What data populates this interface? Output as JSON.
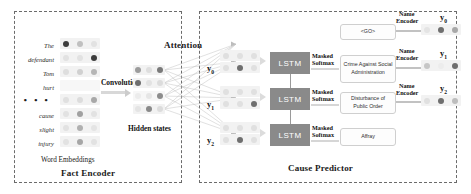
{
  "figure": {
    "width": 471,
    "height": 194,
    "type": "neural-network-architecture-diagram",
    "background": "#ffffff"
  },
  "panels": [
    {
      "id": "fact-encoder",
      "title": "Fact Encoder"
    },
    {
      "id": "cause-predictor",
      "title": "Cause Predictor"
    }
  ],
  "fact_encoder": {
    "title": "Fact Encoder",
    "word_embeddings_caption": "Word Embeddings",
    "hidden_states_caption": "Hidden states",
    "convolution_label": "Convolution",
    "words": [
      {
        "text": "The"
      },
      {
        "text": "defendant"
      },
      {
        "text": "Tom"
      },
      {
        "text": "hurt"
      },
      {
        "text": "• • •",
        "is_ellipsis": true
      },
      {
        "text": "cause"
      },
      {
        "text": "slight"
      },
      {
        "text": "injury"
      }
    ],
    "embedding_rows": [
      {
        "dots": [
          "dark",
          "mid",
          "light"
        ]
      },
      {
        "dots": [
          "light",
          "light",
          "dark"
        ]
      },
      {
        "dots": [
          "light",
          "light",
          "mid"
        ]
      },
      {
        "dots": [
          "blank",
          "blank",
          "blank"
        ]
      },
      {
        "dots": [
          "light",
          "light",
          "mid"
        ]
      },
      {
        "dots": [
          "light",
          "mid",
          "light"
        ]
      },
      {
        "dots": [
          "light",
          "mid",
          "light"
        ]
      },
      {
        "dots": [
          "light",
          "mid",
          "light"
        ]
      }
    ],
    "hidden_state_rows": [
      {
        "dots": [
          "mid",
          "light",
          "dark"
        ]
      },
      {
        "dots": [
          "dark",
          "light",
          "light"
        ]
      },
      {
        "dots": [
          "light",
          "light",
          "dark"
        ]
      },
      {
        "dots": [
          "light",
          "mid",
          "light"
        ]
      }
    ]
  },
  "attention": {
    "label": "Attention"
  },
  "cause_predictor": {
    "title": "Cause Predictor",
    "decoder_steps": [
      {
        "y_label": "y",
        "y_subscript": "0",
        "input_dots": [
          "light",
          "dark",
          "light"
        ],
        "softmax_label": "Masked\nSoftmax",
        "softmax_line1": "Masked",
        "softmax_line2": "Softmax",
        "class_label": "Crime Against Social Administration",
        "name_encoder_line1": "Name",
        "name_encoder_line2": "Encoder",
        "output_label": "y",
        "output_subscript": "0",
        "output_dots": [
          "light",
          "dark",
          "mid"
        ]
      },
      {
        "y_label": "y",
        "y_subscript": "1",
        "input_dots": [
          "light",
          "light",
          "dark"
        ],
        "softmax_line1": "Masked",
        "softmax_line2": "Softmax",
        "class_label": "Disturbance of Public Order",
        "name_encoder_line1": "Name",
        "name_encoder_line2": "Encoder",
        "output_label": "y",
        "output_subscript": "1",
        "output_dots": [
          "mid",
          "light",
          "dark"
        ]
      },
      {
        "y_label": "y",
        "y_subscript": "2",
        "input_dots": [
          "light",
          "dark",
          "light"
        ],
        "softmax_line1": "Masked",
        "softmax_line2": "Softmax",
        "class_label": "Affray",
        "name_encoder_line1": "Name",
        "name_encoder_line2": "Encoder",
        "output_label": "y",
        "output_subscript": "2",
        "output_dots": [
          "light",
          "dark",
          "mid"
        ]
      }
    ],
    "go_token": "<GO>",
    "lstm_blocks": [
      {
        "label": "LSTM"
      },
      {
        "label": "LSTM"
      },
      {
        "label": "LSTM"
      }
    ],
    "class_labels": [
      "<GO>",
      "Crime Against Social Administration",
      "Disturbance of Public Order",
      "Affray"
    ],
    "name_encoder_label": "Name Encoder"
  },
  "colors": {
    "panel_border": "#6b6b6b",
    "lstm_fill": "#8a8a8a",
    "lstm_text": "#ffffff",
    "dot_dark": "#4a4a4a",
    "dot_mid": "#9e9e9e",
    "dot_light": "#dcdcdc",
    "vecrow_bg": "#f2f2f2",
    "connector": "#d6d6d6",
    "labelbox_border": "#cfcfcf",
    "text": "#1a1a1a"
  }
}
